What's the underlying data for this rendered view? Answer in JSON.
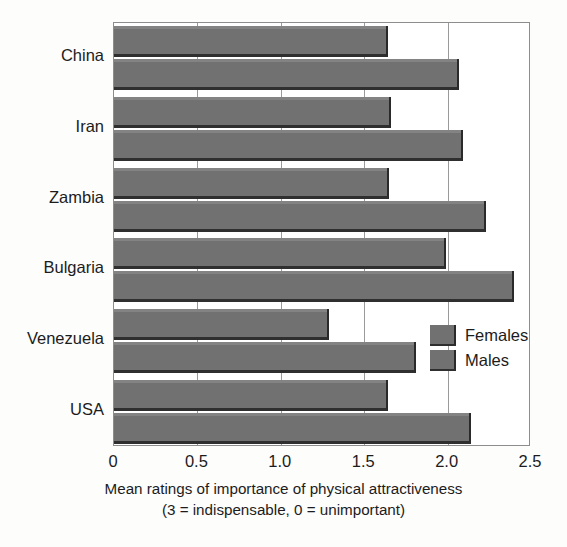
{
  "chart_data": {
    "type": "bar",
    "orientation": "horizontal",
    "title": "",
    "xlabel": "Mean ratings of importance of physical attractiveness",
    "xlabel_line2": "(3 = indispensable, 0 = unimportant)",
    "ylabel": "",
    "categories": [
      "China",
      "Iran",
      "Zambia",
      "Bulgaria",
      "Venezuela",
      "USA"
    ],
    "series": [
      {
        "name": "Females",
        "values": [
          1.64,
          1.66,
          1.65,
          1.99,
          1.29,
          1.64
        ]
      },
      {
        "name": "Males",
        "values": [
          2.07,
          2.09,
          2.23,
          2.4,
          1.81,
          2.14
        ]
      }
    ],
    "xlim": [
      0,
      2.5
    ],
    "xticks": [
      0,
      0.5,
      1.0,
      1.5,
      2.0,
      2.5
    ],
    "xtick_labels": [
      "0",
      "0.5",
      "1.0",
      "1.5",
      "2.0",
      "2.5"
    ],
    "grid": true,
    "grid_axis": "x",
    "legend_position": "inside-right",
    "bar_color": "#717171",
    "bar_edge_color": "#2f2f2f",
    "axis_color": "#8d8d8d",
    "text_color": "#1c1c1c",
    "background": "#ffffff"
  },
  "legend": {
    "entries": [
      {
        "label": "Females"
      },
      {
        "label": "Males"
      }
    ]
  }
}
